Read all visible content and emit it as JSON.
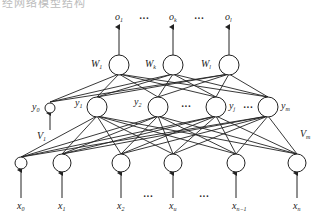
{
  "caption": "经网络模型结构",
  "diagram": {
    "type": "three-layer neural network",
    "output_layer": {
      "nodes": [
        {
          "id": "o1",
          "label": "o",
          "sub": "1",
          "weight_label": "W",
          "weight_sub": "1",
          "x": 119
        },
        {
          "id": "ok",
          "label": "o",
          "sub": "k",
          "weight_label": "W",
          "weight_sub": "k",
          "x": 173
        },
        {
          "id": "ol",
          "label": "o",
          "sub": "l",
          "weight_label": "W",
          "weight_sub": "l",
          "x": 229
        }
      ],
      "ellipsis": "···"
    },
    "hidden_layer": {
      "nodes": [
        {
          "id": "y0",
          "label": "y",
          "sub": "0",
          "x": 50,
          "bias": true
        },
        {
          "id": "y1",
          "label": "y",
          "sub": "1",
          "x": 97
        },
        {
          "id": "y2",
          "label": "y",
          "sub": "2",
          "x": 158
        },
        {
          "id": "yj",
          "label": "y",
          "sub": "j",
          "x": 216
        },
        {
          "id": "ym",
          "label": "y",
          "sub": "m",
          "x": 268
        }
      ],
      "ellipsis": "···"
    },
    "input_layer": {
      "nodes": [
        {
          "id": "x0",
          "label": "x",
          "sub": "0",
          "x": 21,
          "bias": true
        },
        {
          "id": "x1",
          "label": "x",
          "sub": "1",
          "x": 62
        },
        {
          "id": "x2",
          "label": "x",
          "sub": "2",
          "x": 121
        },
        {
          "id": "xu",
          "label": "x",
          "sub": "u",
          "x": 173
        },
        {
          "id": "xn-1",
          "label": "x",
          "sub": "n−1",
          "x": 236
        },
        {
          "id": "xn",
          "label": "x",
          "sub": "n",
          "x": 297
        }
      ],
      "ellipsis": "···"
    },
    "weight_labels": {
      "v1": {
        "label": "V",
        "sub": "1"
      },
      "vm": {
        "label": "V",
        "sub": "m"
      }
    }
  }
}
